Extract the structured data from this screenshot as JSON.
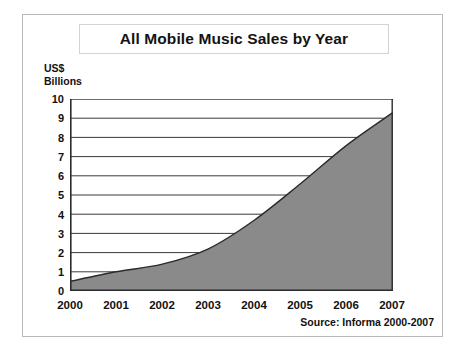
{
  "figure": {
    "title": "All Mobile Music Sales by Year",
    "source_note": "Source: Informa 2000-2007",
    "y_axis_caption_line1": "US$",
    "y_axis_caption_line2": "Billions"
  },
  "chart_data": {
    "type": "area",
    "title": "All Mobile Music Sales by Year",
    "subtitle": "",
    "xlabel": "",
    "ylabel": "US$ Billions",
    "categories": [
      "2000",
      "2001",
      "2002",
      "2003",
      "2004",
      "2005",
      "2006",
      "2007"
    ],
    "x": [
      2000,
      2001,
      2002,
      2003,
      2004,
      2005,
      2006,
      2007
    ],
    "values": [
      0.5,
      1.0,
      1.4,
      2.2,
      3.7,
      5.6,
      7.6,
      9.3
    ],
    "series": [
      {
        "name": "All Mobile Music Sales",
        "values": [
          0.5,
          1.0,
          1.4,
          2.2,
          3.7,
          5.6,
          7.6,
          9.3
        ]
      }
    ],
    "ylim": [
      0,
      10
    ],
    "xlim": [
      2000,
      2007
    ],
    "y_ticks": [
      0,
      1,
      2,
      3,
      4,
      5,
      6,
      7,
      8,
      9,
      10
    ],
    "y_tick_labels": [
      "0",
      "1",
      "2",
      "3",
      "4",
      "5",
      "6",
      "7",
      "8",
      "9",
      "10"
    ],
    "x_ticks": [
      2000,
      2001,
      2002,
      2003,
      2004,
      2005,
      2006,
      2007
    ],
    "x_tick_labels": [
      "2000",
      "2001",
      "2002",
      "2003",
      "2004",
      "2005",
      "2006",
      "2007"
    ],
    "grid": true,
    "grid_axis": "y",
    "legend": false,
    "legend_position": "none",
    "annotations": [
      "Source: Informa 2000-2007"
    ],
    "colors": {
      "area_fill": "#8a8a8a",
      "area_line": "#2b2b2b",
      "gridline": "#3a3a3a",
      "axis": "#2b2b2b",
      "frame": "#b9b9b9",
      "text": "#111111",
      "background": "#ffffff"
    }
  }
}
